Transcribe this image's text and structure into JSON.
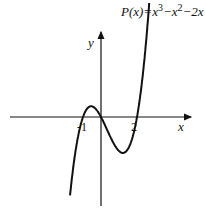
{
  "chart_data": {
    "type": "line",
    "title": "",
    "function_label": {
      "name": "P(x)",
      "expr_parts": [
        "P(x)=x",
        "3",
        "−x",
        "2",
        "−2x"
      ]
    },
    "xlabel": "x",
    "ylabel": "y",
    "x_ticks": [
      {
        "value": -1,
        "label": "-1"
      },
      {
        "value": 2,
        "label": "2"
      }
    ],
    "coefficients": [
      1,
      -1,
      -2,
      0
    ],
    "xlim": [
      -5,
      5
    ],
    "x_samples": [
      -1.65,
      -1.5,
      -1.25,
      -1,
      -0.75,
      -0.5,
      -0.25,
      0,
      0.25,
      0.5,
      0.75,
      1,
      1.25,
      1.5,
      1.75,
      2,
      2.25,
      2.5,
      2.7
    ],
    "roots": [
      -1,
      0,
      2
    ],
    "color": "#111111"
  }
}
